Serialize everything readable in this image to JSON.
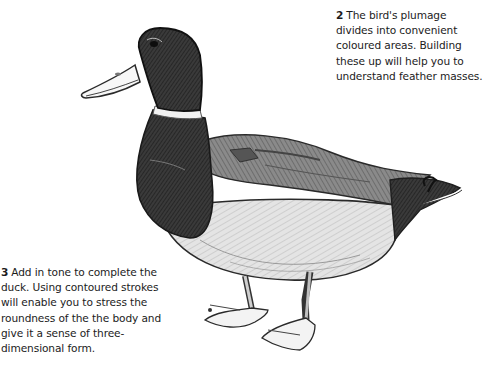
{
  "page": {
    "illustration": {
      "subject": "duck",
      "description": "Pencil sketch of a mallard duck standing, facing left"
    },
    "captions": [
      {
        "number": "2",
        "text": "The bird's plumage divides into convenient coloured areas. Building these up will help you to understand feather masses.",
        "lines": [
          "The bird's plumage",
          "divides into convenient",
          "coloured areas. Building",
          "these up will help you to",
          "understand feather masses."
        ]
      },
      {
        "number": "3",
        "text": "Add in tone to complete the duck. Using contoured strokes will enable you to stress the roundness of the the body and give it a sense of three-dimensional form.",
        "lines": [
          "Add in tone to complete",
          "the duck. Using contoured",
          "strokes will enable you to",
          "stress the roundness of the",
          "the body and give it a sense",
          "of three-dimensional form."
        ]
      }
    ]
  }
}
